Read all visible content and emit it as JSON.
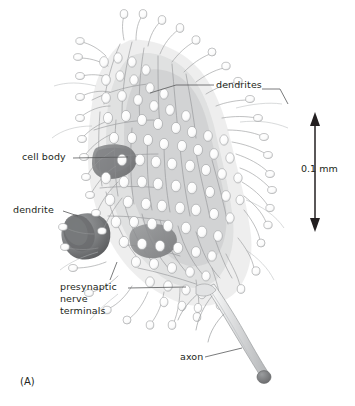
{
  "figure": {
    "panel_letter": "(A)",
    "background_color": "#ffffff",
    "ink_color": "#231f20"
  },
  "labels": {
    "dendrites": "dendrites",
    "cell_body": "cell body",
    "dendrite": "dendrite",
    "presynaptic_nerve_terminals": "presynaptic\nnerve\nterminals",
    "axon": "axon"
  },
  "scale_bar": {
    "value": "0.1 mm",
    "orientation": "vertical",
    "arrowheads": "both"
  },
  "drawing": {
    "style": "pencil-shaded line drawing",
    "structures": [
      "cell body",
      "dendrites",
      "dendritic spines",
      "presynaptic nerve terminals",
      "axon"
    ],
    "shading_colors": {
      "light": "#d8d9da",
      "mid": "#a7a9ac",
      "dark": "#6d6e71",
      "outline": "#808285"
    }
  }
}
